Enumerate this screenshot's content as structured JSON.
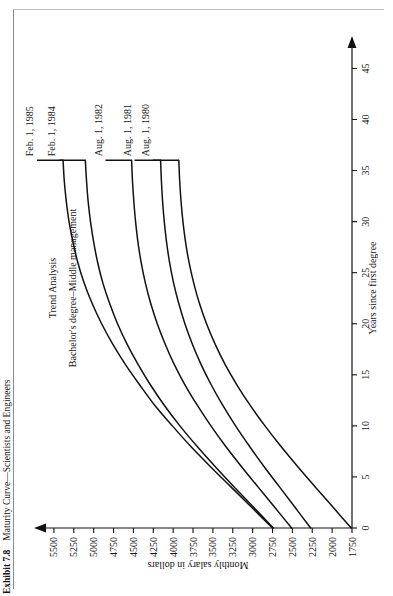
{
  "caption": {
    "exhibit_number": "Exhibit 7.8",
    "title": "Maturity Curve—Scientists and Engineers"
  },
  "chart_data": {
    "type": "line",
    "title": "Trend Analysis",
    "subtitle": "Bachelor's degree–Middle management",
    "xlabel": "Years since first degree",
    "ylabel": "Monthly salary in dollars",
    "xlim": [
      0,
      47
    ],
    "ylim": [
      1750,
      5625
    ],
    "grid": false,
    "legend": "inline-right-end-labels",
    "xticks": [
      0,
      5,
      10,
      15,
      20,
      25,
      30,
      35,
      40,
      45
    ],
    "yticks": [
      1750,
      2000,
      2250,
      2500,
      2750,
      3000,
      3250,
      3500,
      3750,
      4000,
      4250,
      4500,
      4750,
      5000,
      5250,
      5500
    ],
    "x": [
      0,
      2,
      4,
      6,
      8,
      10,
      12,
      14,
      16,
      18,
      20,
      22,
      24,
      26,
      28,
      30,
      32,
      34,
      36
    ],
    "series": [
      {
        "name": "Feb. 1, 1985",
        "label": "Feb. 1, 1985",
        "values": [
          2750,
          3010,
          3270,
          3530,
          3780,
          4010,
          4230,
          4420,
          4600,
          4760,
          4900,
          5020,
          5120,
          5200,
          5260,
          5310,
          5345,
          5370,
          5385
        ]
      },
      {
        "name": "Feb. 1, 1984",
        "label": "Feb. 1, 1984",
        "values": [
          2740,
          2985,
          3230,
          3470,
          3700,
          3915,
          4110,
          4285,
          4440,
          4580,
          4700,
          4800,
          4885,
          4950,
          5000,
          5040,
          5070,
          5090,
          5105
        ]
      },
      {
        "name": "Aug. 1, 1982",
        "label": "Aug. 1, 1982",
        "values": [
          2510,
          2720,
          2930,
          3140,
          3340,
          3525,
          3695,
          3850,
          3985,
          4100,
          4200,
          4283,
          4350,
          4403,
          4443,
          4473,
          4495,
          4512,
          4523
        ]
      },
      {
        "name": "Aug. 1, 1981",
        "label": "Aug. 1, 1981",
        "values": [
          2270,
          2465,
          2660,
          2855,
          3040,
          3215,
          3375,
          3520,
          3648,
          3758,
          3852,
          3930,
          3995,
          4045,
          4083,
          4112,
          4133,
          4148,
          4158
        ]
      },
      {
        "name": "Aug. 1, 1980",
        "label": "Aug. 1, 1980",
        "values": [
          1760,
          1985,
          2210,
          2432,
          2645,
          2845,
          3030,
          3197,
          3345,
          3472,
          3580,
          3670,
          3742,
          3800,
          3844,
          3877,
          3901,
          3918,
          3929
        ]
      }
    ]
  }
}
